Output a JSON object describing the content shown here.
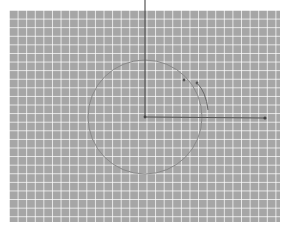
{
  "diagram": {
    "background": {
      "fill": "#a6a6a6",
      "grid_color": "#ffffff",
      "grid_spacing_px": 8.6
    },
    "axes": {
      "origin": {
        "x": 145,
        "y": 117
      },
      "y_axis_top": {
        "x": 145,
        "y": 0
      },
      "x_axis_end": {
        "x": 266,
        "y": 118
      },
      "color": "#555555"
    },
    "circle": {
      "cx": 145,
      "cy": 117,
      "r": 57,
      "color": "#8a8a8a"
    },
    "points": [
      {
        "x": 184,
        "y": 80
      },
      {
        "x": 197,
        "y": 83
      }
    ],
    "arc": {
      "start": {
        "x": 197,
        "y": 83
      },
      "end": {
        "x": 208,
        "y": 110
      },
      "color": "#666666"
    }
  }
}
